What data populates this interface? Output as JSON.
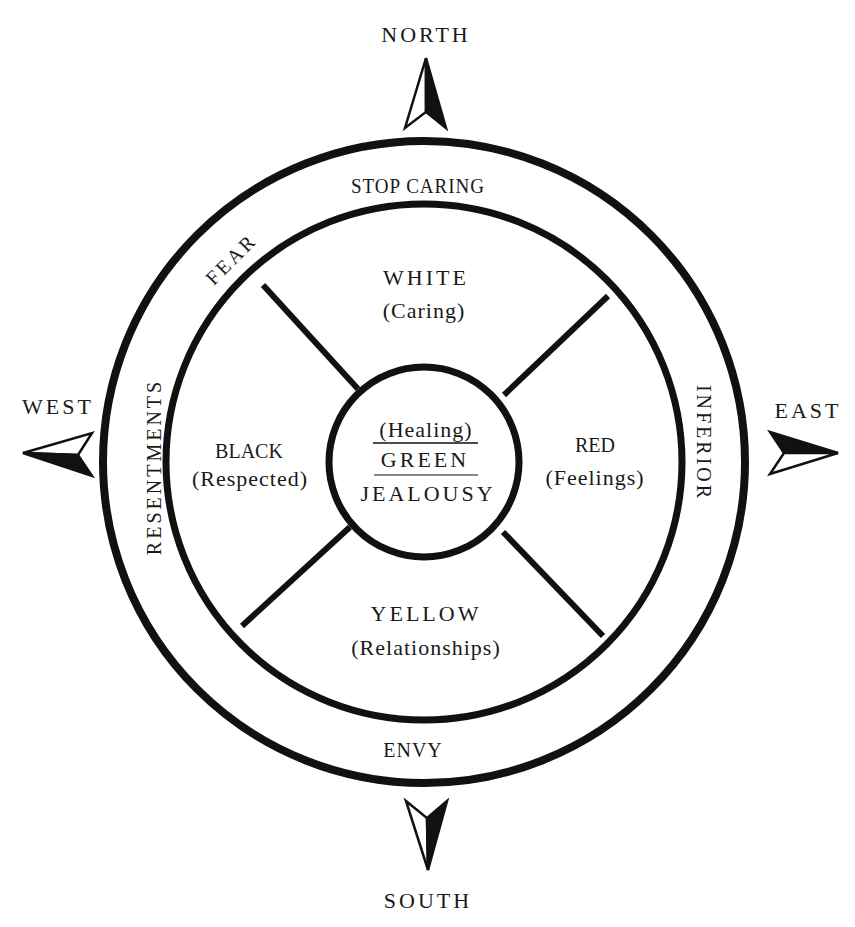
{
  "directions": {
    "north": "NORTH",
    "south": "SOUTH",
    "east": "EAST",
    "west": "WEST"
  },
  "outer_ring": {
    "top": "STOP CARING",
    "top_left": "FEAR",
    "left": "RESENTMENTS",
    "right": "INFERIOR",
    "bottom": "ENVY"
  },
  "quadrants": {
    "top": {
      "color": "WHITE",
      "meaning": "(Caring)"
    },
    "left": {
      "color": "BLACK",
      "meaning": "(Respected)"
    },
    "right": {
      "color": "RED",
      "meaning": "(Feelings)"
    },
    "bottom": {
      "color": "YELLOW",
      "meaning": "(Relationships)"
    }
  },
  "center": {
    "meaning": "(Healing)",
    "color": "GREEN",
    "emotion": "JEALOUSY"
  },
  "colors": {
    "stroke": "#111111",
    "text": "#1a1a1a",
    "background": "#ffffff"
  }
}
